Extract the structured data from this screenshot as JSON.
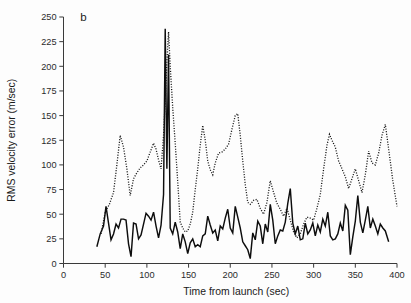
{
  "figure": {
    "panel_label": "b",
    "background_color": "#fdfdfd"
  },
  "chart_data": {
    "type": "line",
    "title": "",
    "subtitle": "",
    "xlabel": "Time from launch (sec)",
    "ylabel": "RMS velocity error (m/sec)",
    "xlim": [
      0,
      400
    ],
    "ylim": [
      0,
      250
    ],
    "xticks": [
      0,
      50,
      100,
      150,
      200,
      250,
      300,
      350,
      400
    ],
    "yticks": [
      0,
      25,
      50,
      75,
      100,
      125,
      150,
      175,
      200,
      225,
      250
    ],
    "xticklabels": [
      "0",
      "50",
      "100",
      "150",
      "200",
      "250",
      "300",
      "350",
      "400"
    ],
    "yticklabels": [
      "0",
      "25",
      "50",
      "75",
      "100",
      "125",
      "150",
      "175",
      "200",
      "225",
      "250"
    ],
    "grid": false,
    "legend": null,
    "legend_position": "none",
    "annotations": [
      {
        "text": "b",
        "x": 20,
        "y": 246
      }
    ],
    "series": [
      {
        "name": "solid-trace",
        "style": "solid",
        "color": "#0d0d0d",
        "x": [
          40,
          44,
          48,
          51,
          54,
          57,
          60,
          63,
          66,
          69,
          72,
          75,
          78,
          81,
          84,
          87,
          90,
          93,
          96,
          99,
          102,
          105,
          108,
          111,
          114,
          117,
          120,
          122,
          124,
          126,
          128,
          131,
          134,
          137,
          140,
          143,
          146,
          149,
          152,
          155,
          158,
          161,
          164,
          167,
          170,
          173,
          176,
          179,
          182,
          185,
          188,
          191,
          194,
          197,
          200,
          203,
          206,
          209,
          212,
          215,
          218,
          221,
          224,
          227,
          230,
          233,
          236,
          239,
          242,
          245,
          248,
          251,
          254,
          257,
          260,
          263,
          266,
          269,
          272,
          275,
          278,
          281,
          284,
          287,
          290,
          293,
          296,
          299,
          302,
          305,
          308,
          311,
          314,
          317,
          320,
          323,
          326,
          329,
          332,
          335,
          338,
          341,
          344,
          347,
          350,
          353,
          356,
          359,
          362,
          365,
          368,
          371,
          374,
          377,
          380,
          383,
          386,
          390
        ],
        "y": [
          17,
          30,
          38,
          58,
          41,
          24,
          30,
          40,
          36,
          45,
          45,
          44,
          20,
          7,
          41,
          40,
          25,
          29,
          40,
          51,
          48,
          44,
          52,
          38,
          26,
          39,
          70,
          238,
          96,
          212,
          36,
          30,
          42,
          32,
          15,
          30,
          22,
          10,
          21,
          25,
          17,
          19,
          17,
          28,
          30,
          48,
          39,
          31,
          34,
          23,
          38,
          35,
          46,
          55,
          36,
          31,
          58,
          47,
          36,
          22,
          18,
          14,
          5,
          31,
          24,
          43,
          38,
          20,
          40,
          32,
          60,
          44,
          20,
          28,
          34,
          33,
          42,
          61,
          76,
          41,
          30,
          38,
          24,
          25,
          41,
          30,
          34,
          41,
          28,
          39,
          32,
          45,
          38,
          52,
          28,
          24,
          25,
          30,
          41,
          33,
          59,
          54,
          9,
          27,
          43,
          69,
          42,
          31,
          44,
          58,
          36,
          45,
          38,
          30,
          40,
          36,
          33,
          22
        ]
      },
      {
        "name": "dotted-trace",
        "style": "dotted",
        "color": "#141414",
        "x": [
          45,
          50,
          55,
          60,
          64,
          68,
          72,
          76,
          80,
          84,
          88,
          92,
          96,
          100,
          104,
          108,
          111,
          114,
          117,
          120,
          122,
          124,
          126,
          128,
          131,
          134,
          137,
          140,
          143,
          146,
          149,
          152,
          155,
          158,
          161,
          164,
          167,
          170,
          173,
          176,
          179,
          182,
          186,
          190,
          194,
          198,
          202,
          206,
          209,
          212,
          215,
          218,
          221,
          224,
          228,
          232,
          236,
          240,
          244,
          248,
          252,
          256,
          260,
          264,
          268,
          272,
          276,
          280,
          284,
          288,
          292,
          296,
          300,
          304,
          308,
          312,
          316,
          319,
          322,
          326,
          330,
          334,
          338,
          342,
          346,
          350,
          354,
          358,
          362,
          366,
          370,
          374,
          378,
          382,
          386,
          390,
          395,
          400
        ],
        "y": [
          30,
          52,
          60,
          72,
          100,
          130,
          118,
          96,
          69,
          86,
          92,
          97,
          100,
          104,
          113,
          122,
          116,
          105,
          96,
          130,
          165,
          205,
          235,
          200,
          158,
          122,
          83,
          42,
          36,
          32,
          33,
          40,
          52,
          75,
          96,
          120,
          140,
          125,
          104,
          95,
          90,
          102,
          112,
          113,
          116,
          121,
          136,
          150,
          152,
          130,
          104,
          80,
          62,
          60,
          64,
          65,
          56,
          50,
          62,
          84,
          72,
          61,
          55,
          48,
          56,
          44,
          32,
          26,
          30,
          40,
          47,
          46,
          44,
          56,
          70,
          96,
          120,
          131,
          125,
          118,
          104,
          96,
          88,
          76,
          86,
          96,
          84,
          72,
          90,
          114,
          102,
          100,
          112,
          130,
          141,
          116,
          84,
          58
        ]
      }
    ]
  }
}
